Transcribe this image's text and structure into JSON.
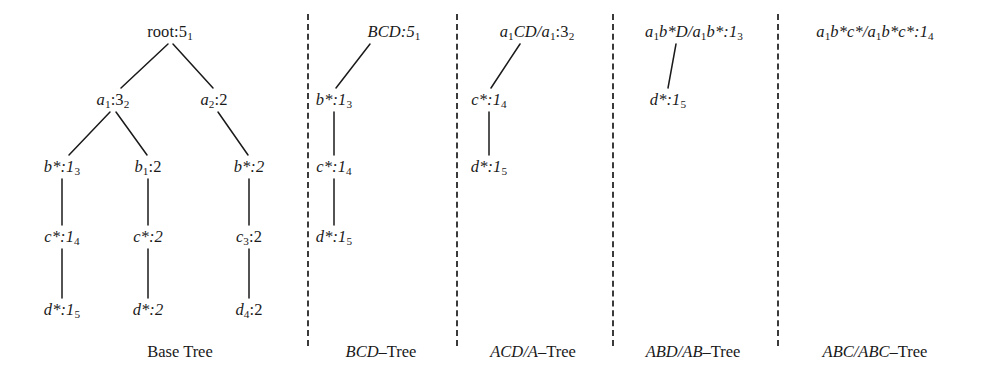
{
  "figure": {
    "type": "tree-diagram",
    "background_color": "#ffffff",
    "ink_color": "#1a1a1a",
    "panel_count": 5,
    "separator_style": "vertical-dashed"
  },
  "panels": [
    {
      "id": "base-tree",
      "caption": "Base Tree",
      "caption_style": "upright",
      "nodes": [
        {
          "id": "root",
          "label": "root:5",
          "sub": "1",
          "x": 170,
          "y": 32,
          "style": "upright"
        },
        {
          "id": "a1",
          "label": "a",
          "sub1": "1",
          "rest": ":3",
          "sub": "2",
          "x": 113,
          "y": 100,
          "style": "italic-var"
        },
        {
          "id": "a2",
          "label": "a",
          "sub1": "2",
          "rest": ":2",
          "sub": "",
          "x": 214,
          "y": 100,
          "style": "italic-var"
        },
        {
          "id": "b-star-left",
          "label": "b*:1",
          "sub": "3",
          "x": 60,
          "y": 167,
          "style": "italic-var"
        },
        {
          "id": "b1",
          "label": "b",
          "sub1": "1",
          "rest": ":2",
          "sub": "",
          "x": 144,
          "y": 167,
          "style": "italic-var"
        },
        {
          "id": "b-star-right",
          "label": "b*:2",
          "sub": "",
          "x": 245,
          "y": 167,
          "style": "italic-var"
        },
        {
          "id": "c-star-1",
          "label": "c*:1",
          "sub": "4",
          "x": 60,
          "y": 237,
          "style": "italic-var"
        },
        {
          "id": "c-star-2",
          "label": "c*:2",
          "sub": "",
          "x": 144,
          "y": 237,
          "style": "italic-var"
        },
        {
          "id": "c3",
          "label": "c",
          "sub1": "3",
          "rest": ":2",
          "sub": "",
          "x": 245,
          "y": 237,
          "style": "italic-var"
        },
        {
          "id": "d-star-1",
          "label": "d*:1",
          "sub": "5",
          "x": 60,
          "y": 310,
          "style": "italic-var"
        },
        {
          "id": "d-star-2",
          "label": "d*:2",
          "sub": "",
          "x": 144,
          "y": 310,
          "style": "italic-var"
        },
        {
          "id": "d4",
          "label": "d",
          "sub1": "4",
          "rest": ":2",
          "sub": "",
          "x": 245,
          "y": 310,
          "style": "italic-var"
        }
      ],
      "edges": [
        {
          "from": "root",
          "to": "a1"
        },
        {
          "from": "root",
          "to": "a2"
        },
        {
          "from": "a1",
          "to": "b-star-left"
        },
        {
          "from": "a1",
          "to": "b1"
        },
        {
          "from": "a2",
          "to": "b-star-right"
        },
        {
          "from": "b-star-left",
          "to": "c-star-1"
        },
        {
          "from": "b1",
          "to": "c-star-2"
        },
        {
          "from": "b-star-right",
          "to": "c3"
        },
        {
          "from": "c-star-1",
          "to": "d-star-1"
        },
        {
          "from": "c-star-2",
          "to": "d-star-2"
        },
        {
          "from": "c3",
          "to": "d4"
        }
      ]
    },
    {
      "id": "bcd-tree",
      "caption": "BCD–Tree",
      "caption_italic_part": "BCD",
      "caption_upright_part": "–Tree",
      "nodes": [
        {
          "id": "bcd-root",
          "label": "BCD:5",
          "sub": "1",
          "x": 392,
          "y": 32,
          "style": "italic-caps"
        },
        {
          "id": "bcd-b",
          "label": "b*:1",
          "sub": "3",
          "x": 332,
          "y": 100,
          "style": "italic-var"
        },
        {
          "id": "bcd-c",
          "label": "c*:1",
          "sub": "4",
          "x": 332,
          "y": 167,
          "style": "italic-var"
        },
        {
          "id": "bcd-d",
          "label": "d*:1",
          "sub": "5",
          "x": 332,
          "y": 237,
          "style": "italic-var"
        }
      ],
      "edges": [
        {
          "from": "bcd-root",
          "to": "bcd-b"
        },
        {
          "from": "bcd-b",
          "to": "bcd-c"
        },
        {
          "from": "bcd-c",
          "to": "bcd-d"
        }
      ]
    },
    {
      "id": "acd-a-tree",
      "caption": "ACD/A–Tree",
      "caption_italic_part": "ACD/A",
      "caption_upright_part": "–Tree",
      "nodes": [
        {
          "id": "acd-root",
          "label": "a",
          "sub1": "1",
          "rest": "CD/a",
          "sub2": "1",
          "rest2": ":3",
          "sub": "2",
          "x": 536,
          "y": 32,
          "style": "italic-mixed"
        },
        {
          "id": "acd-c",
          "label": "c*:1",
          "sub": "4",
          "x": 487,
          "y": 100,
          "style": "italic-var"
        },
        {
          "id": "acd-d",
          "label": "d*:1",
          "sub": "5",
          "x": 487,
          "y": 167,
          "style": "italic-var"
        }
      ],
      "edges": [
        {
          "from": "acd-root",
          "to": "acd-c"
        },
        {
          "from": "acd-c",
          "to": "acd-d"
        }
      ]
    },
    {
      "id": "abd-ab-tree",
      "caption": "ABD/AB–Tree",
      "caption_italic_part": "ABD/AB",
      "caption_upright_part": "–Tree",
      "nodes": [
        {
          "id": "abd-root",
          "label": "a",
          "sub1": "1",
          "rest": "b*D/a",
          "sub2": "1",
          "rest2": "b*:1",
          "sub": "3",
          "x": 692,
          "y": 32,
          "style": "italic-mixed"
        },
        {
          "id": "abd-d",
          "label": "d*:1",
          "sub": "5",
          "x": 665,
          "y": 100,
          "style": "italic-var"
        }
      ],
      "edges": [
        {
          "from": "abd-root",
          "to": "abd-d"
        }
      ]
    },
    {
      "id": "abc-abc-tree",
      "caption": "ABC/ABC–Tree",
      "caption_italic_part": "ABC/ABC",
      "caption_upright_part": "–Tree",
      "nodes": [
        {
          "id": "abc-root",
          "label": "a",
          "sub1": "1",
          "rest": "b*c*/a",
          "sub2": "1",
          "rest2": "b*c*:1",
          "sub": "4",
          "x": 873,
          "y": 32,
          "style": "italic-mixed"
        }
      ],
      "edges": []
    }
  ],
  "separators": {
    "x_positions": [
      307,
      456,
      612,
      777
    ],
    "top": 14,
    "bottom": 346,
    "color": "#3a3a3a"
  },
  "captions": {
    "base_tree": {
      "text": "Base Tree",
      "x": 180,
      "y": 352
    },
    "bcd_tree": {
      "italic": "BCD",
      "upright": "–Tree",
      "x": 381,
      "y": 352
    },
    "acd_a_tree": {
      "italic": "ACD/A",
      "upright": "–Tree",
      "x": 533,
      "y": 352
    },
    "abd_ab_tree": {
      "italic": "ABD/AB",
      "upright": "–Tree",
      "x": 693,
      "y": 352
    },
    "abc_abc_tree": {
      "italic": "ABC/ABC",
      "upright": "–Tree",
      "x": 875,
      "y": 352
    }
  },
  "node_text": {
    "root": "root:5",
    "root_sub": "1",
    "a1_base": "a",
    "a1_sub": "1",
    "a1_tail": ":3",
    "a1_tail_sub": "2",
    "a2_base": "a",
    "a2_sub": "2",
    "a2_tail": ":2",
    "b_star_1": "b*:1",
    "b_star_1_sub": "3",
    "b1_base": "b",
    "b1_sub": "1",
    "b1_tail": ":2",
    "b_star_2": "b*:2",
    "c_star_1": "c*:1",
    "c_star_1_sub": "4",
    "c_star_2": "c*:2",
    "c3_base": "c",
    "c3_sub": "3",
    "c3_tail": ":2",
    "d_star_1": "d*:1",
    "d_star_1_sub": "5",
    "d_star_2": "d*:2",
    "d4_base": "d",
    "d4_sub": "4",
    "d4_tail": ":2",
    "bcd_root": "BCD:5",
    "bcd_root_sub": "1",
    "bcd_b": "b*:1",
    "bcd_b_sub": "3",
    "bcd_c": "c*:1",
    "bcd_c_sub": "4",
    "bcd_d": "d*:1",
    "bcd_d_sub": "5",
    "acd_root_a": "a",
    "acd_root_a_sub": "1",
    "acd_root_mid": "CD/a",
    "acd_root_a2_sub": "1",
    "acd_root_tail": ":3",
    "acd_root_tail_sub": "2",
    "acd_c": "c*:1",
    "acd_c_sub": "4",
    "acd_d": "d*:1",
    "acd_d_sub": "5",
    "abd_root_a": "a",
    "abd_root_a_sub": "1",
    "abd_root_mid": "b*D/a",
    "abd_root_a2_sub": "1",
    "abd_root_tail": "b*:1",
    "abd_root_tail_sub": "3",
    "abd_d": "d*:1",
    "abd_d_sub": "5",
    "abc_root_a": "a",
    "abc_root_a_sub": "1",
    "abc_root_mid": "b*c*/a",
    "abc_root_a2_sub": "1",
    "abc_root_tail": "b*c*:1",
    "abc_root_tail_sub": "4"
  }
}
